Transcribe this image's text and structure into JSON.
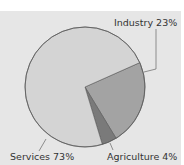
{
  "chart_data": {
    "type": "pie",
    "title": "",
    "categories": [
      "Industry",
      "Agriculture",
      "Services"
    ],
    "values": [
      23,
      4,
      73
    ],
    "unit": "%",
    "labels": [
      "Industry 23%",
      "Agriculture 4%",
      "Services 73%"
    ],
    "colors": [
      "#a3a3a3",
      "#7a7a7a",
      "#d4d4d4"
    ],
    "start_angle_deg": -24,
    "direction": "clockwise",
    "legend": "none (direct labels with leader lines)"
  },
  "colors": {
    "background": "#e6e6e6",
    "outline": "#5a5a5a",
    "text": "#333333"
  }
}
